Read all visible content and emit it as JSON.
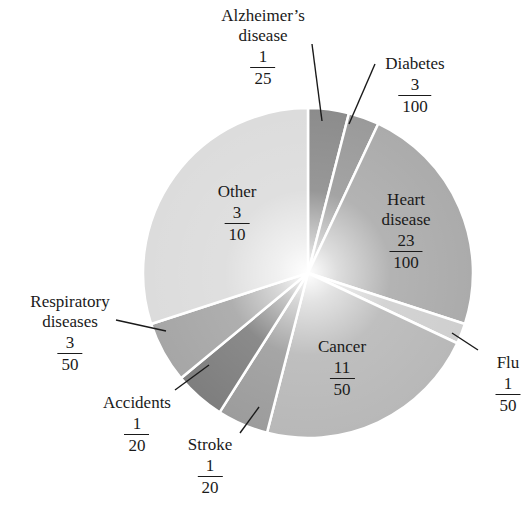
{
  "chart_data": {
    "type": "pie",
    "title": "",
    "start_angle_deg": 0,
    "direction": "clockwise",
    "slices": [
      {
        "label": "Alzheimer's disease",
        "numerator": "1",
        "denominator": "25",
        "value": 0.04,
        "color": "#8c8c8c"
      },
      {
        "label": "Diabetes",
        "numerator": "3",
        "denominator": "100",
        "value": 0.03,
        "color": "#9a9a9a"
      },
      {
        "label": "Heart disease",
        "numerator": "23",
        "denominator": "100",
        "value": 0.23,
        "color": "#ababab"
      },
      {
        "label": "Flu",
        "numerator": "1",
        "denominator": "50",
        "value": 0.02,
        "color": "#cfcfcf"
      },
      {
        "label": "Cancer",
        "numerator": "11",
        "denominator": "50",
        "value": 0.22,
        "color": "#b8b8b8"
      },
      {
        "label": "Stroke",
        "numerator": "1",
        "denominator": "20",
        "value": 0.05,
        "color": "#9c9c9c"
      },
      {
        "label": "Accidents",
        "numerator": "1",
        "denominator": "20",
        "value": 0.05,
        "color": "#7e7e7e"
      },
      {
        "label": "Respiratory diseases",
        "numerator": "3",
        "denominator": "50",
        "value": 0.06,
        "color": "#a6a6a6"
      },
      {
        "label": "Other",
        "numerator": "3",
        "denominator": "10",
        "value": 0.3,
        "color": "#dcdcdc"
      }
    ],
    "legend": "none (labels placed on/around slices)"
  },
  "labels": {
    "alzheimers": {
      "line1": "Alzheimer’s",
      "line2": "disease",
      "num": "1",
      "den": "25"
    },
    "diabetes": {
      "line1": "Diabetes",
      "num": "3",
      "den": "100"
    },
    "heart": {
      "line1": "Heart",
      "line2": "disease",
      "num": "23",
      "den": "100"
    },
    "flu": {
      "line1": "Flu",
      "num": "1",
      "den": "50"
    },
    "cancer": {
      "line1": "Cancer",
      "num": "11",
      "den": "50"
    },
    "stroke": {
      "line1": "Stroke",
      "num": "1",
      "den": "20"
    },
    "accidents": {
      "line1": "Accidents",
      "num": "1",
      "den": "20"
    },
    "respiratory": {
      "line1": "Respiratory",
      "line2": "diseases",
      "num": "3",
      "den": "50"
    },
    "other": {
      "line1": "Other",
      "num": "3",
      "den": "10"
    }
  }
}
